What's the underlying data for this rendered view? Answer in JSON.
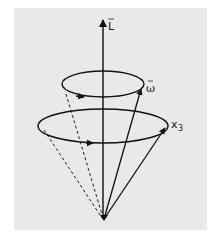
{
  "figure": {
    "background_color": "#e9e9e9",
    "stroke_color": "#111111",
    "labels": {
      "angular_momentum": "L",
      "angular_velocity": "ω",
      "body_axis": "x",
      "body_axis_subscript": "3"
    },
    "elements": {
      "axis_L": {
        "x": 103,
        "y_top": 18,
        "y_bottom": 219
      },
      "apex": {
        "x": 104,
        "y": 219
      },
      "small_ellipse": {
        "cx": 103,
        "cy": 84,
        "rx": 41,
        "ry": 13
      },
      "large_ellipse": {
        "cx": 103,
        "cy": 126,
        "rx": 65,
        "ry": 17
      },
      "omega_vector_tip": {
        "x": 142,
        "y": 86
      },
      "x3_vector_tip": {
        "x": 167,
        "y": 125
      }
    }
  }
}
